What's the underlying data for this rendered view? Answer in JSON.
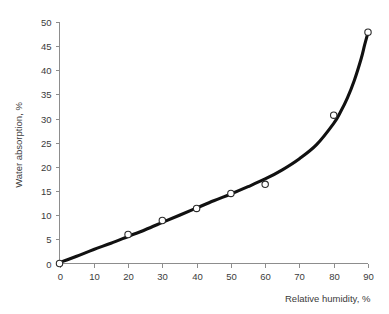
{
  "chart_data": {
    "type": "line",
    "title": "",
    "xlabel": "Relative humidity, %",
    "ylabel": "Water absorption, %",
    "xlim": [
      0,
      90
    ],
    "ylim": [
      0,
      50
    ],
    "xticks": [
      0,
      10,
      20,
      30,
      40,
      50,
      60,
      70,
      80,
      90
    ],
    "yticks": [
      0,
      5,
      10,
      15,
      20,
      25,
      30,
      35,
      40,
      45,
      50
    ],
    "xtick_labels": [
      "0",
      "10",
      "20",
      "30",
      "40",
      "50",
      "60",
      "70",
      "80",
      "90"
    ],
    "ytick_labels": [
      "0",
      "5",
      "10",
      "15",
      "20",
      "25",
      "30",
      "35",
      "40",
      "45",
      "50"
    ],
    "grid": false,
    "legend": false,
    "legend_position": "none",
    "series": [
      {
        "name": "Water absorption",
        "marker": "open-circle",
        "marker_color": "#ffffff",
        "marker_edge_color": "#2a2a2a",
        "line_color": "#111111",
        "x": [
          0,
          20,
          30,
          40,
          50,
          60,
          80,
          90
        ],
        "values": [
          0.0,
          6.0,
          8.9,
          11.4,
          14.5,
          16.4,
          30.7,
          47.9
        ]
      }
    ],
    "fit_curve": {
      "name": "fitted-trend",
      "x": [
        0,
        5,
        10,
        15,
        20,
        25,
        30,
        35,
        40,
        45,
        50,
        55,
        60,
        65,
        70,
        75,
        80,
        82,
        84,
        86,
        88,
        89,
        90
      ],
      "y": [
        0.2,
        1.5,
        2.9,
        4.2,
        5.6,
        7.0,
        8.5,
        10.0,
        11.5,
        13.0,
        14.4,
        15.9,
        17.5,
        19.4,
        21.7,
        24.6,
        29.0,
        31.4,
        34.3,
        37.9,
        42.4,
        45.2,
        47.8
      ]
    }
  },
  "axis": {
    "x_title": "Relative humidity, %",
    "y_title": "Water absorption, %"
  },
  "colors": {
    "background": "#ffffff",
    "axis": "#8d8d8d",
    "text": "#3b3b3b",
    "curve": "#111111",
    "marker_fill": "#ffffff",
    "marker_edge": "#2a2a2a"
  }
}
